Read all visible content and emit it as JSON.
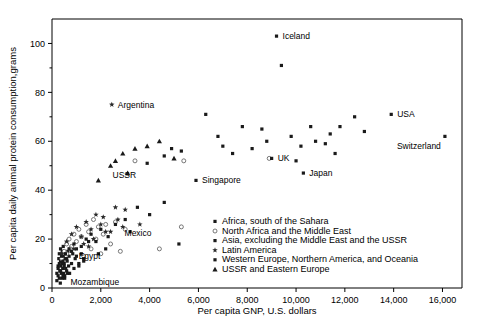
{
  "chart_data": {
    "type": "scatter",
    "title": "",
    "xlabel": "Per capita GNP, U.S. dollars",
    "ylabel": "Per capita daily animal protein consumption,grams",
    "xlim": [
      0,
      16800
    ],
    "ylim": [
      0,
      110
    ],
    "xticks": [
      0,
      2000,
      4000,
      6000,
      8000,
      10000,
      12000,
      14000,
      16000
    ],
    "xticklabels": [
      "0",
      "2,000",
      "4,000",
      "6,000",
      "8,000",
      "10,000",
      "12,000",
      "14,000",
      "16,000"
    ],
    "yticks": [
      0,
      20,
      40,
      60,
      80,
      100
    ],
    "yticklabels": [
      "0",
      "20",
      "40",
      "60",
      "80",
      "100"
    ],
    "yminorticks": [
      10,
      30,
      50,
      70,
      90
    ],
    "grid": false,
    "legend_position": "inside-lower-right",
    "legend": [
      {
        "key": "africa_sahara",
        "label": "Africa, south of the Sahara",
        "marker": "filled"
      },
      {
        "key": "north_africa_me",
        "label": "North Africa and the Middle East",
        "marker": "open"
      },
      {
        "key": "asia",
        "label": "Asia, excluding the Middle East and the USSR",
        "marker": "filled"
      },
      {
        "key": "latin_america",
        "label": "Latin America",
        "marker": "star"
      },
      {
        "key": "western_europe",
        "label": "Western Europe, Northern America, and Oceania",
        "marker": "filled"
      },
      {
        "key": "ussr_eastern_europe",
        "label": "USSR and Eastern Europe",
        "marker": "triangle"
      }
    ],
    "annotations": [
      {
        "text": "Iceland",
        "x": 9200,
        "y": 103,
        "dx": 6,
        "dy": 3
      },
      {
        "text": "Argentina",
        "x": 2450,
        "y": 75,
        "dx": 6,
        "dy": 3
      },
      {
        "text": "USA",
        "x": 13900,
        "y": 71,
        "dx": 6,
        "dy": 3
      },
      {
        "text": "Switzerland",
        "x": 16100,
        "y": 62,
        "dx": -48,
        "dy": 13
      },
      {
        "text": "UK",
        "x": 9000,
        "y": 53,
        "dx": 6,
        "dy": 3
      },
      {
        "text": "Japan",
        "x": 10300,
        "y": 47,
        "dx": 6,
        "dy": 3
      },
      {
        "text": "USSR",
        "x": 2400,
        "y": 50,
        "dx": 2,
        "dy": 12
      },
      {
        "text": "Singapore",
        "x": 5900,
        "y": 44,
        "dx": 6,
        "dy": 3
      },
      {
        "text": "Mexico",
        "x": 2400,
        "y": 23,
        "dx": 14,
        "dy": 4
      },
      {
        "text": "Egypt",
        "x": 600,
        "y": 14,
        "dx": 12,
        "dy": 5
      },
      {
        "text": "Mozambique",
        "x": 350,
        "y": 4,
        "dx": 10,
        "dy": 7
      }
    ],
    "series": [
      {
        "name": "Africa, south of the Sahara",
        "marker": "filled",
        "points": [
          [
            200,
            3
          ],
          [
            250,
            5
          ],
          [
            300,
            4
          ],
          [
            320,
            7
          ],
          [
            340,
            2
          ],
          [
            360,
            9
          ],
          [
            380,
            6
          ],
          [
            400,
            11
          ],
          [
            420,
            4
          ],
          [
            440,
            8
          ],
          [
            460,
            13
          ],
          [
            480,
            6
          ],
          [
            500,
            10
          ],
          [
            520,
            5
          ],
          [
            540,
            12
          ],
          [
            560,
            8
          ],
          [
            300,
            14
          ],
          [
            350,
            16
          ],
          [
            600,
            7
          ],
          [
            620,
            11
          ],
          [
            650,
            15
          ],
          [
            680,
            9
          ],
          [
            700,
            13
          ],
          [
            720,
            6
          ],
          [
            250,
            9
          ],
          [
            280,
            12
          ],
          [
            420,
            15
          ],
          [
            460,
            17
          ],
          [
            800,
            10
          ],
          [
            850,
            14
          ],
          [
            900,
            8
          ],
          [
            950,
            12
          ],
          [
            1000,
            16
          ],
          [
            1100,
            9
          ],
          [
            1200,
            14
          ],
          [
            1300,
            11
          ],
          [
            1500,
            19
          ],
          [
            350,
            11
          ],
          [
            390,
            13
          ],
          [
            430,
            10
          ]
        ]
      },
      {
        "name": "North Africa and the Middle East",
        "marker": "open",
        "points": [
          [
            400,
            12
          ],
          [
            500,
            15
          ],
          [
            600,
            18
          ],
          [
            700,
            20
          ],
          [
            800,
            17
          ],
          [
            900,
            22
          ],
          [
            1000,
            19
          ],
          [
            1100,
            24
          ],
          [
            1200,
            21
          ],
          [
            1400,
            26
          ],
          [
            1500,
            23
          ],
          [
            1700,
            28
          ],
          [
            1900,
            25
          ],
          [
            2100,
            22
          ],
          [
            2400,
            18
          ],
          [
            2600,
            27
          ],
          [
            3000,
            24
          ],
          [
            3400,
            52
          ],
          [
            5400,
            52
          ],
          [
            600,
            14
          ],
          [
            750,
            16
          ],
          [
            1300,
            13
          ],
          [
            1600,
            16
          ],
          [
            2000,
            14
          ],
          [
            2800,
            15
          ],
          [
            4400,
            16
          ],
          [
            1800,
            20
          ],
          [
            2200,
            26
          ],
          [
            5300,
            25
          ],
          [
            8900,
            53
          ]
        ]
      },
      {
        "name": "Asia, excluding the Middle East and the USSR",
        "marker": "filled",
        "points": [
          [
            200,
            6
          ],
          [
            250,
            8
          ],
          [
            300,
            10
          ],
          [
            350,
            7
          ],
          [
            400,
            13
          ],
          [
            450,
            11
          ],
          [
            500,
            9
          ],
          [
            550,
            14
          ],
          [
            600,
            12
          ],
          [
            700,
            16
          ],
          [
            800,
            15
          ],
          [
            900,
            18
          ],
          [
            1000,
            13
          ],
          [
            1200,
            17
          ],
          [
            1400,
            20
          ],
          [
            1600,
            22
          ],
          [
            1800,
            19
          ],
          [
            2000,
            24
          ],
          [
            2300,
            21
          ],
          [
            2600,
            26
          ],
          [
            3000,
            28
          ],
          [
            3500,
            33
          ],
          [
            4000,
            30
          ],
          [
            5900,
            44
          ],
          [
            10300,
            47
          ],
          [
            450,
            5
          ],
          [
            520,
            4
          ],
          [
            640,
            6
          ],
          [
            1100,
            10
          ],
          [
            1300,
            12
          ],
          [
            1900,
            14
          ],
          [
            2200,
            16
          ],
          [
            3200,
            23
          ],
          [
            4600,
            35
          ],
          [
            5200,
            18
          ]
        ]
      },
      {
        "name": "Latin America",
        "marker": "star",
        "points": [
          [
            400,
            14
          ],
          [
            600,
            19
          ],
          [
            800,
            22
          ],
          [
            1000,
            25
          ],
          [
            1200,
            21
          ],
          [
            1400,
            27
          ],
          [
            1600,
            24
          ],
          [
            1800,
            30
          ],
          [
            2000,
            26
          ],
          [
            2200,
            23
          ],
          [
            2400,
            23
          ],
          [
            2700,
            28
          ],
          [
            3000,
            32
          ],
          [
            1300,
            18
          ],
          [
            1700,
            20
          ],
          [
            2100,
            29
          ],
          [
            2900,
            25
          ],
          [
            2450,
            75
          ],
          [
            1500,
            17
          ],
          [
            900,
            16
          ],
          [
            3600,
            26
          ],
          [
            2600,
            33
          ]
        ]
      },
      {
        "name": "Western Europe, Northern America, and Oceania",
        "marker": "filled",
        "points": [
          [
            6300,
            71
          ],
          [
            7800,
            66
          ],
          [
            8600,
            65
          ],
          [
            9200,
            103
          ],
          [
            9400,
            91
          ],
          [
            9800,
            62
          ],
          [
            10200,
            58
          ],
          [
            10600,
            66
          ],
          [
            10800,
            60
          ],
          [
            11200,
            59
          ],
          [
            11400,
            63
          ],
          [
            11800,
            66
          ],
          [
            12400,
            70
          ],
          [
            13900,
            71
          ],
          [
            16100,
            62
          ],
          [
            9000,
            53
          ],
          [
            8200,
            57
          ],
          [
            7000,
            58
          ],
          [
            5300,
            56
          ],
          [
            4600,
            54
          ],
          [
            3900,
            51
          ],
          [
            4900,
            57
          ],
          [
            6800,
            62
          ],
          [
            7400,
            55
          ],
          [
            11600,
            55
          ],
          [
            12800,
            64
          ],
          [
            10000,
            52
          ],
          [
            8800,
            60
          ]
        ]
      },
      {
        "name": "USSR and Eastern Europe",
        "marker": "triangle",
        "points": [
          [
            2400,
            50
          ],
          [
            2900,
            55
          ],
          [
            3400,
            57
          ],
          [
            3900,
            58
          ],
          [
            4400,
            60
          ],
          [
            1900,
            44
          ],
          [
            2600,
            52
          ],
          [
            3100,
            47
          ],
          [
            5000,
            53
          ]
        ]
      }
    ]
  }
}
